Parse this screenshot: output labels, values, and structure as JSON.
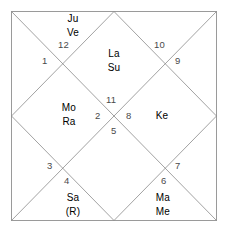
{
  "chart": {
    "style": "north-indian-kundali",
    "border_color": "#9a9a9a",
    "line_color": "#8a8a8a",
    "text_color": "#4a4a4a",
    "background": "#ffffff"
  },
  "houses": [
    {
      "number": "1",
      "planets": []
    },
    {
      "number": "2",
      "planets": []
    },
    {
      "number": "3",
      "planets": []
    },
    {
      "number": "4",
      "planets": [
        "Sa",
        "(R)"
      ]
    },
    {
      "number": "5",
      "planets": []
    },
    {
      "number": "6",
      "planets": [
        "Ma",
        "Me"
      ]
    },
    {
      "number": "7",
      "planets": []
    },
    {
      "number": "8",
      "planets": []
    },
    {
      "number": "9",
      "planets": []
    },
    {
      "number": "10",
      "planets": [
        "La",
        "Su"
      ]
    },
    {
      "number": "11",
      "planets": [
        "Ke"
      ]
    },
    {
      "number": "12",
      "planets": [
        "Ju",
        "Ve"
      ]
    }
  ],
  "house_numbers": {
    "h1": "1",
    "h2": "2",
    "h3": "3",
    "h4": "4",
    "h5": "5",
    "h6": "6",
    "h7": "7",
    "h8": "8",
    "h9": "9",
    "h10": "10",
    "h11": "11",
    "h12": "12"
  },
  "planet_labels": {
    "top_left_1": "Ju",
    "top_left_2": "Ve",
    "top_center_1": "La",
    "top_center_2": "Su",
    "left_center_1": "Mo",
    "left_center_2": "Ra",
    "right_center_1": "Ke",
    "bottom_left_1": "Sa",
    "bottom_left_2": "(R)",
    "bottom_right_1": "Ma",
    "bottom_right_2": "Me"
  },
  "legend": {
    "La": "Lagna",
    "Su": "Sun",
    "Mo": "Moon",
    "Ma": "Mars",
    "Me": "Mercury",
    "Ju": "Jupiter",
    "Ve": "Venus",
    "Sa": "Saturn",
    "Ra": "Rahu",
    "Ke": "Ketu",
    "(R)": "Retrograde"
  }
}
